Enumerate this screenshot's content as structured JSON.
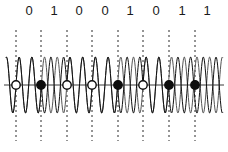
{
  "figure": {
    "title": "",
    "background_color": "#ffffff",
    "width": 228,
    "height": 152
  },
  "bit_labels": {
    "name": "bit-sequence-labels",
    "bits": [
      "0",
      "1",
      "0",
      "0",
      "1",
      "0",
      "1",
      "1"
    ],
    "color": "#1a1a1a",
    "font_size": 13,
    "y": 3,
    "x_positions": [
      29,
      54,
      79,
      105,
      130,
      156,
      182,
      207
    ]
  },
  "chart_data": {
    "type": "line",
    "title": "",
    "subtitle": "",
    "xlabel": "",
    "ylabel": "",
    "grid": false,
    "legend_position": "none",
    "axis": {
      "baseline_y": 85,
      "x_start": 4,
      "x_end": 224,
      "color": "#3b3b3b",
      "line_width": 1
    },
    "bit_sequence": [
      "0",
      "1",
      "0",
      "0",
      "1",
      "0",
      "1",
      "1"
    ],
    "bit_boundaries_x": [
      16,
      41,
      67,
      92,
      118,
      143,
      169,
      195
    ],
    "bit_period_px": 25.4,
    "carrier": {
      "name": "reference-carrier",
      "cycles_per_bit": 2,
      "amplitude_px": 28,
      "phase_deg": 0,
      "color": "#555555",
      "line_width": 1,
      "x_start": 6,
      "x_end": 223
    },
    "modulated": {
      "name": "phase-shift-keyed-signal",
      "cycles_per_bit": 2,
      "amplitude_px": 28,
      "phase_deg_for_bit_0": 0,
      "phase_deg_for_bit_1": 180,
      "color": "#111111",
      "line_width": 1,
      "x_start": 6,
      "x_end": 223
    },
    "sample_markers": {
      "name": "bit-sample-markers",
      "radius_px": 4.2,
      "marker_for_0": "open-circle",
      "marker_for_1": "filled-circle",
      "open_fill": "#ffffff",
      "filled_fill": "#0d0d0d",
      "stroke": "#0d0d0d",
      "stroke_width": 1.4,
      "states": [
        "open",
        "filled",
        "open",
        "open",
        "filled",
        "open",
        "filled",
        "filled"
      ]
    },
    "dashed_lines": {
      "name": "bit-boundary-dashed-lines",
      "y_top": 30,
      "y_bottom": 141,
      "color": "#2b2b2b",
      "line_width": 1,
      "dash_pattern": "2 3",
      "count": 8
    },
    "series": [
      {
        "name": "reference-carrier",
        "values_description": "continuous sinusoid, 2 cycles per bit period, constant phase"
      },
      {
        "name": "phase-shift-keyed-signal",
        "values_description": "sinusoid, 2 cycles per bit period, phase inverted (180 deg) during bit value 1"
      }
    ],
    "ylim": [
      -28,
      28
    ],
    "xlim": [
      4,
      224
    ]
  }
}
